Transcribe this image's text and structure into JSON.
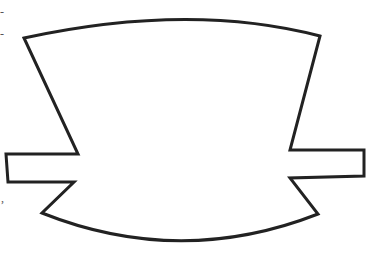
{
  "figure": {
    "stroke_color": "#222222",
    "fill_color": "#ffffff",
    "background": "#ffffff",
    "stroke_width": 3,
    "shape": {
      "top_left": [
        24,
        38
      ],
      "top_peak": [
        190,
        20
      ],
      "top_right": [
        320,
        36
      ],
      "right_upper_inner": [
        290,
        150
      ],
      "right_tab": {
        "top_left": [
          290,
          150
        ],
        "top_right": [
          364,
          150
        ],
        "bottom_right": [
          364,
          176
        ],
        "bottom_left": [
          290,
          178
        ]
      },
      "bottom_right": [
        318,
        214
      ],
      "bottom_low": [
        180,
        244
      ],
      "bottom_left": [
        42,
        213
      ],
      "left_tab": {
        "top_right": [
          78,
          154
        ],
        "top_left": [
          6,
          154
        ],
        "bottom_left": [
          8,
          182
        ],
        "bottom_right": [
          74,
          182
        ]
      }
    }
  },
  "edge_marks": {
    "mark_1": "-",
    "mark_2": "-",
    "mark_3": ","
  }
}
